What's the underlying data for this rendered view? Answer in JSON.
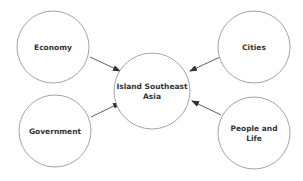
{
  "diagram": {
    "type": "concept-map",
    "center": {
      "label_lines": [
        "Island Southeast",
        "Asia"
      ],
      "cx": 152,
      "cy": 91,
      "r": 38
    },
    "nodes": [
      {
        "id": "economy",
        "label_lines": [
          "Economy"
        ],
        "cx": 53,
        "cy": 47,
        "r": 36
      },
      {
        "id": "cities",
        "label_lines": [
          "Cities"
        ],
        "cx": 254,
        "cy": 47,
        "r": 36
      },
      {
        "id": "government",
        "label_lines": [
          "Government"
        ],
        "cx": 55,
        "cy": 131,
        "r": 36
      },
      {
        "id": "people-and-life",
        "label_lines": [
          "People and",
          "Life"
        ],
        "cx": 254,
        "cy": 133,
        "r": 36
      }
    ],
    "edges": [
      {
        "from": "economy",
        "to": "center"
      },
      {
        "from": "cities",
        "to": "center"
      },
      {
        "from": "government",
        "to": "center"
      },
      {
        "from": "people-and-life",
        "to": "center"
      }
    ],
    "colors": {
      "circle_stroke": "#9a9a9a",
      "arrow": "#333333",
      "text": "#333333"
    }
  }
}
